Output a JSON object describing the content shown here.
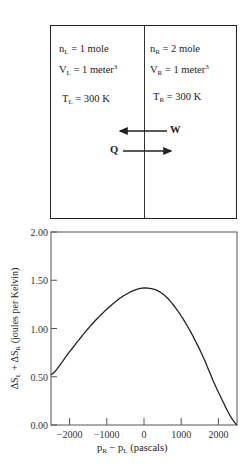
{
  "diagram": {
    "left": {
      "n": {
        "sym": "n",
        "sub": "L",
        "val": " = 1 mole"
      },
      "V": {
        "sym": "V",
        "sub": "L",
        "val": " = 1 meter",
        "sup": "3"
      },
      "T": {
        "sym": "T",
        "sub": "L",
        "val": " = 300 K"
      }
    },
    "right": {
      "n": {
        "sym": "n",
        "sub": "R",
        "val": " = 2 mole"
      },
      "V": {
        "sym": "V",
        "sub": "R",
        "val": " = 1 meter",
        "sup": "3"
      },
      "T": {
        "sym": "T",
        "sub": "R",
        "val": " = 300 K"
      }
    },
    "work_label": "W",
    "heat_label": "Q"
  },
  "chart_data": {
    "type": "line",
    "title": "",
    "xlabel": "pR − pL (pascals)",
    "ylabel": "ΔSL + ΔSR (joules per Kelvin)",
    "xlim": [
      -2500,
      2500
    ],
    "ylim": [
      0,
      2
    ],
    "xticks": [
      -2000,
      -1000,
      0,
      1000,
      2000
    ],
    "xtick_labels": [
      "−2000",
      "−1000",
      "0",
      "1000",
      "2000"
    ],
    "yticks": [
      0,
      0.5,
      1.0,
      1.5,
      2.0
    ],
    "ytick_labels": [
      "0.00",
      "0.50",
      "1.00",
      "1.50",
      "2.00"
    ],
    "grid": false,
    "x": [
      -2500,
      -2000,
      -1500,
      -1000,
      -500,
      0,
      500,
      1000,
      1500,
      2000,
      2500
    ],
    "values": [
      0.52,
      0.76,
      1.0,
      1.2,
      1.35,
      1.42,
      1.36,
      1.13,
      0.78,
      0.34,
      0.0
    ]
  },
  "axis_text": {
    "xlabel_main": "p",
    "xlabel_sub1": "R",
    "xlabel_mid": " − p",
    "xlabel_sub2": "L",
    "xlabel_tail": " (pascals)",
    "ylabel_tail": " (joules per Kelvin)"
  }
}
